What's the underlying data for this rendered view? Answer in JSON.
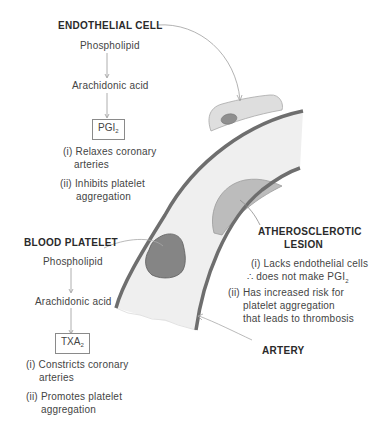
{
  "colors": {
    "wall": "#6e6e6e",
    "lumen": "#eeeeee",
    "cell_fill": "#dcdcdc",
    "nucleus_fill": "#8e8e8e",
    "platelet_fill": "#858585",
    "lesion_fill": "#bdbdbd",
    "text": "#444444",
    "leader": "#a0a0a0"
  },
  "endothelial": {
    "title": "ENDOTHELIAL CELL",
    "step1": "Phospholipid",
    "step2": "Arachidonic acid",
    "product": "PGI",
    "product_sub": "2",
    "effects": [
      {
        "num": "(i)",
        "line1": "Relaxes coronary",
        "line2": "arteries"
      },
      {
        "num": "(ii)",
        "line1": "Inhibits platelet",
        "line2": "aggregation"
      }
    ]
  },
  "platelet": {
    "title": "BLOOD PLATELET",
    "step1": "Phospholipid",
    "step2": "Arachidonic acid",
    "product": "TXA",
    "product_sub": "2",
    "effects": [
      {
        "num": "(i)",
        "line1": "Constricts coronary",
        "line2": "arteries"
      },
      {
        "num": "(ii)",
        "line1": "Promotes platelet",
        "line2": "aggregation"
      }
    ]
  },
  "lesion": {
    "title_line1": "ATHEROSCLEROTIC",
    "title_line2": "LESION",
    "effects": [
      {
        "num": "(i)",
        "line1": "Lacks endothelial cells",
        "line2": "∴ does not make PGI",
        "line2_sub": "2"
      },
      {
        "num": "(ii)",
        "line1": "Has increased risk for",
        "line2": "platelet aggregation",
        "line3": "that leads to thrombosis"
      }
    ]
  },
  "artery": {
    "label": "ARTERY"
  }
}
